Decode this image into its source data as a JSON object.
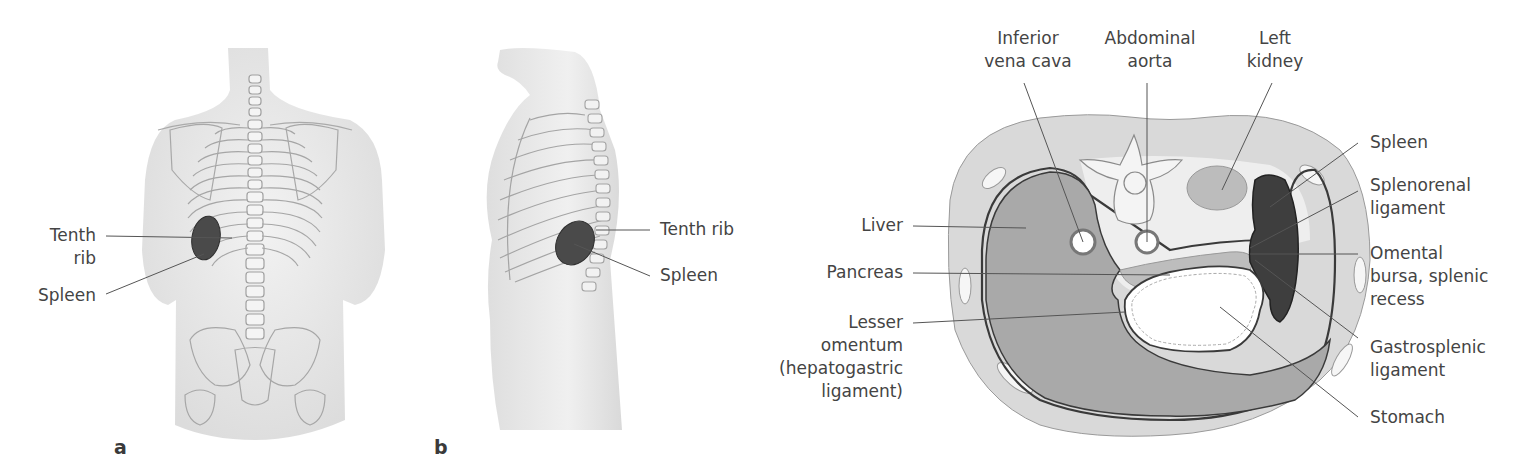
{
  "figure": {
    "panels": [
      {
        "id": "a",
        "letter": "a",
        "view": "posterior torso",
        "labels": [
          {
            "line1": "Tenth",
            "line2": "rib"
          },
          {
            "line1": "Spleen"
          }
        ]
      },
      {
        "id": "b",
        "letter": "b",
        "view": "left lateral torso",
        "labels": [
          {
            "line1": "Tenth rib"
          },
          {
            "line1": "Spleen"
          }
        ]
      },
      {
        "id": "c",
        "view": "transverse abdominal section",
        "top_labels": [
          {
            "line1": "Inferior",
            "line2": "vena cava"
          },
          {
            "line1": "Abdominal",
            "line2": "aorta"
          },
          {
            "line1": "Left",
            "line2": "kidney"
          }
        ],
        "left_labels": [
          {
            "line1": "Liver"
          },
          {
            "line1": "Pancreas"
          },
          {
            "line1": "Lesser",
            "line2": "omentum",
            "line3": "(hepatogastric",
            "line4": "ligament)"
          }
        ],
        "right_labels": [
          {
            "line1": "Spleen"
          },
          {
            "line1": "Splenorenal",
            "line2": "ligament"
          },
          {
            "line1": "Omental",
            "line2": "bursa, splenic",
            "line3": "recess"
          },
          {
            "line1": "Gastrosplenic",
            "line2": "ligament"
          },
          {
            "line1": "Stomach"
          }
        ]
      }
    ],
    "colors": {
      "skin": "#e9e9e9",
      "bone_line": "#9a9a9a",
      "spleen": "#4a4a4a",
      "liver": "#a9a9a9",
      "body_wall": "#d8d8d8",
      "retroperitoneum": "#eeeeee",
      "leader": "#555555"
    }
  }
}
